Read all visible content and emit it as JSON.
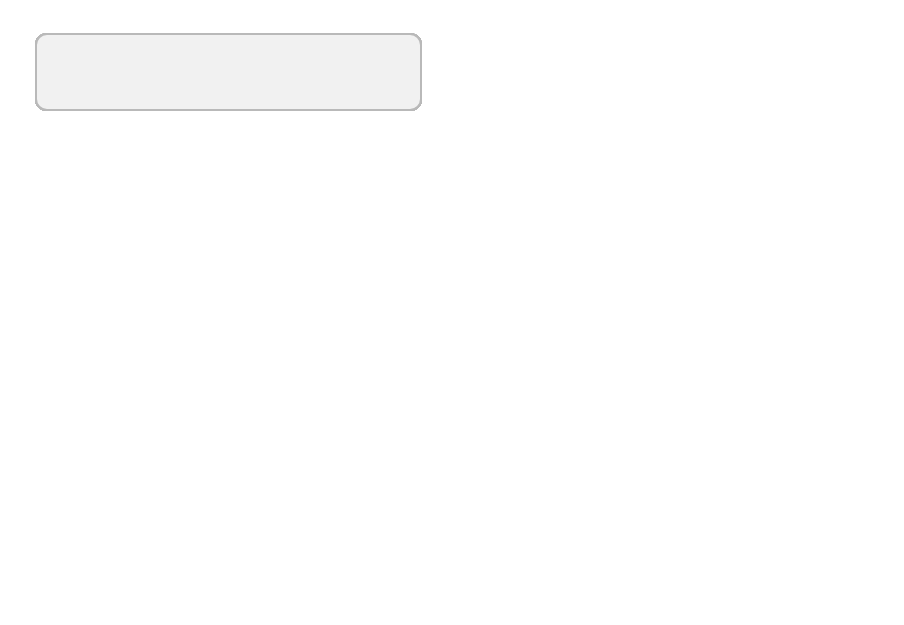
{
  "public_policies": {
    "title": "Public policies",
    "columns": [
      "Agricultural support\nPlanning and transport",
      "Employment\nSocial security",
      "Food prices\nTrade",
      "Retail, catering\nAdvertising",
      "Education\nMass media"
    ]
  },
  "food_availability": {
    "title": "Food availability",
    "items": [
      "Food grown and\nimported",
      "Food available in\nshops",
      "Food eaten\noutside the home,\nin schools,\nworkplace\ncanteens",
      "Land, tools and\nseed for home\nproduction"
    ]
  },
  "food_access": {
    "title": "Food access",
    "items": [
      "Access to shops",
      "Time and ability\nto go shopping",
      "Cost and\naffordability of\nfood",
      "Domestic\nstorage, kitchen\nequipment"
    ]
  },
  "food_knowledge": {
    "title": "Food knowledge",
    "items": [
      "Skills in budgeting,\nshopping and\ncooking",
      "Nutrition education",
      "Breastfeeding\nsupport",
      "Food labelling,\nadvertising,\nmarketing",
      "Media reports and\nfeatures"
    ]
  },
  "personal_choices": {
    "title": "Personal choices",
    "items": [
      "Cultural beliefs, family structure,\nindividual medical needs"
    ]
  },
  "family_practices": {
    "title": "Family practices",
    "items": [
      "Household food\ndistribution (to parents,\nchildren, grandparents)"
    ]
  },
  "needs_tastes": {
    "title": "Needs and\ntastes",
    "items": [
      "Personal beliefs\nand convictions",
      "Likes and dislikes"
    ]
  },
  "household_food_security": {
    "title": "Household food security",
    "items": [
      "Food obtained"
    ]
  },
  "nutrition_security": {
    "title": "Nutrition security",
    "items": [
      "Food consumed"
    ]
  },
  "colors": {
    "box_fill": "#f1f1f1",
    "box_border": "#b9b9b9",
    "arrow": "#2a2a2a"
  }
}
